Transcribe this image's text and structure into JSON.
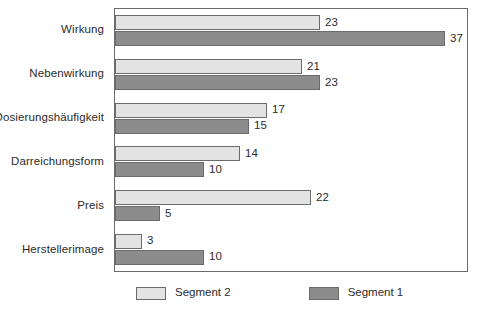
{
  "chart_data": {
    "type": "bar",
    "orientation": "horizontal",
    "title": "",
    "subtitle": "",
    "xlabel": "",
    "ylabel": "",
    "grid": false,
    "legend_position": "bottom",
    "xlim": [
      0,
      37
    ],
    "categories": [
      "Wirkung",
      "Nebenwirkung",
      "Dosierungshäufigkeit",
      "Darreichungsform",
      "Preis",
      "Herstellerimage"
    ],
    "series": [
      {
        "name": "Segment 2",
        "color": "#e3e3e3",
        "values": [
          23,
          21,
          17,
          14,
          22,
          3
        ]
      },
      {
        "name": "Segment 1",
        "color": "#8c8c8c",
        "values": [
          37,
          23,
          15,
          10,
          5,
          10
        ]
      }
    ],
    "data_labels": [
      [
        "23",
        "37"
      ],
      [
        "21",
        "23"
      ],
      [
        "17",
        "15"
      ],
      [
        "14",
        "10"
      ],
      [
        "22",
        "5"
      ],
      [
        "3",
        "10"
      ]
    ]
  },
  "legend": {
    "items": [
      {
        "label": "Segment 2",
        "swatch": "seg2"
      },
      {
        "label": "Segment 1",
        "swatch": "seg1"
      }
    ]
  },
  "colors": {
    "segment_2": "#e3e3e3",
    "segment_1": "#8c8c8c",
    "border": "#6b6b6b",
    "text": "#2b2b2b",
    "background": "#ffffff"
  }
}
